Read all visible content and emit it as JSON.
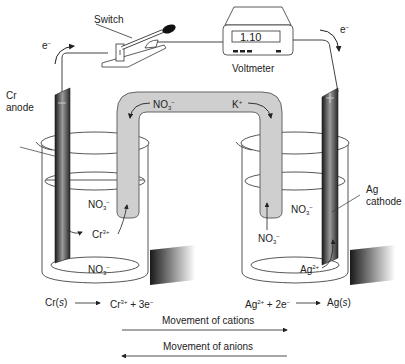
{
  "labels": {
    "switch": "Switch",
    "voltmeter": "Voltmeter",
    "voltmeter_reading": "1.10",
    "electron_left": "e",
    "electron_right": "e",
    "electron_charge": "−",
    "anode_metal": "Cr",
    "anode_word": "anode",
    "cathode_metal": "Ag",
    "cathode_word": "cathode",
    "anode_sign": "−",
    "cathode_sign": "+"
  },
  "salt_bridge": {
    "anion": "NO",
    "anion_sub": "3",
    "anion_sup": "−",
    "cation": "K",
    "cation_sup": "+"
  },
  "left_beaker": {
    "ion_top": "NO",
    "ion_top_sub": "3",
    "ion_top_sup": "−",
    "metal_ion": "Cr",
    "metal_ion_sup": "3+",
    "ion_bottom": "NO",
    "ion_bottom_sub": "3",
    "ion_bottom_sup": "−"
  },
  "right_beaker": {
    "ion_top": "NO",
    "ion_top_sub": "3",
    "ion_top_sup": "−",
    "ion_from_bridge": "NO",
    "ion_from_bridge_sub": "3",
    "ion_from_bridge_sup": "−",
    "metal_ion": "Ag",
    "metal_ion_sup": "2+"
  },
  "reactions": {
    "anode": {
      "reactant": "Cr(",
      "state": "s",
      "close": ")",
      "product": "Cr",
      "product_sup": "3+",
      "product_rest": " + 3e",
      "electron_sup": "−"
    },
    "cathode": {
      "reactant": "Ag",
      "reactant_sup": "2+",
      "reactant_rest": " + 2e",
      "electron_sup": "−",
      "product": "Ag(",
      "state": "s",
      "close": ")"
    }
  },
  "movement": {
    "cations": "Movement of cations",
    "anions": "Movement of anions"
  }
}
